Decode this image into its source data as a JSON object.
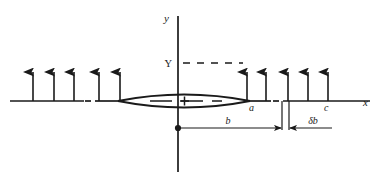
{
  "figure": {
    "type": "physics-schematic",
    "background_color": "#ffffff",
    "ink_color": "#1a1a1a"
  },
  "axes": {
    "x_label": "x",
    "y_label": "y",
    "x_axis": {
      "x_start": 10,
      "x_end": 370,
      "y": 101
    },
    "y_axis": {
      "x": 178,
      "y_start": 16,
      "y_end": 172
    }
  },
  "labels": {
    "Y": "Y",
    "a": "a",
    "c": "c",
    "b": "b",
    "delta_b": "δb",
    "center_marker": "+"
  },
  "arrows_left": {
    "count": 5,
    "x_positions": [
      33,
      54,
      74,
      99,
      120
    ],
    "tip_y": 63,
    "base_y": 101
  },
  "arrows_right": {
    "count": 5,
    "x_positions": [
      247,
      266,
      288,
      308,
      328
    ],
    "tip_y": 63,
    "base_y": 101
  },
  "lens": {
    "x_left": 118,
    "x_right": 250,
    "center_x": 184,
    "center_y": 101,
    "half_height": 11
  },
  "dimension_b": {
    "label": "b",
    "from_x": 178,
    "to_x": 282,
    "y": 128,
    "label_x": 228,
    "label_y": 122
  },
  "dimension_delta_b": {
    "label": "δb",
    "from_x": 288,
    "to_x": 330,
    "y": 128,
    "label_x": 312,
    "label_y": 122
  },
  "dashed_segments": {
    "Y_level_line": {
      "x_start": 183,
      "x_end": 243,
      "y": 63
    },
    "lens_center_line": {
      "x_start": 150,
      "x_end": 222,
      "y": 101
    },
    "axis_break_left": {
      "x_start": 84,
      "x_end": 92,
      "y": 101
    },
    "axis_break_right": {
      "x_start": 272,
      "x_end": 281,
      "y": 101
    }
  }
}
